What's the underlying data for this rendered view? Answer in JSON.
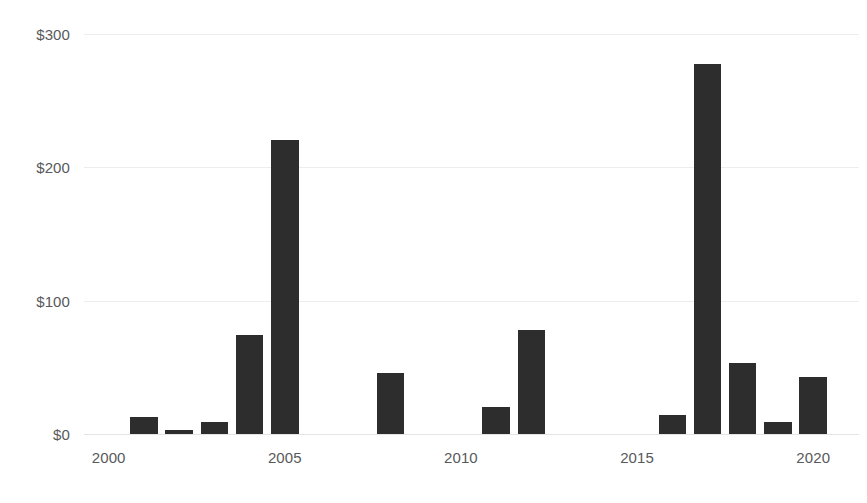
{
  "chart_data": {
    "type": "bar",
    "title": "",
    "subtitle": "",
    "xlabel": "",
    "ylabel": "",
    "xlim": [
      1999.3,
      2021.3
    ],
    "ylim": [
      0,
      300
    ],
    "grid": true,
    "legend": false,
    "bar_color": "#2d2d2d",
    "gridline_color": "#ededed",
    "axis_label_color": "#58595b",
    "background_color": "#ffffff",
    "y_ticks": [
      {
        "value": 0,
        "label": "$0"
      },
      {
        "value": 100,
        "label": "$100"
      },
      {
        "value": 200,
        "label": "$200"
      },
      {
        "value": 300,
        "label": "$300"
      }
    ],
    "x_ticks": [
      {
        "value": 2000,
        "label": "2000"
      },
      {
        "value": 2005,
        "label": "2005"
      },
      {
        "value": 2010,
        "label": "2010"
      },
      {
        "value": 2015,
        "label": "2015"
      },
      {
        "value": 2020,
        "label": "2020"
      }
    ],
    "categories": [
      2001,
      2002,
      2003,
      2004,
      2005,
      2008,
      2011,
      2012,
      2016,
      2017,
      2018,
      2019,
      2020
    ],
    "values": [
      13,
      3,
      9,
      74,
      220,
      46,
      20,
      78,
      14,
      277,
      53,
      9,
      43
    ],
    "bars": [
      {
        "x": 2001,
        "value": 13
      },
      {
        "x": 2002,
        "value": 3
      },
      {
        "x": 2003,
        "value": 9
      },
      {
        "x": 2004,
        "value": 74
      },
      {
        "x": 2005,
        "value": 220
      },
      {
        "x": 2008,
        "value": 46
      },
      {
        "x": 2011,
        "value": 20
      },
      {
        "x": 2012,
        "value": 78
      },
      {
        "x": 2016,
        "value": 14
      },
      {
        "x": 2017,
        "value": 277
      },
      {
        "x": 2018,
        "value": 53
      },
      {
        "x": 2019,
        "value": 9
      },
      {
        "x": 2020,
        "value": 43
      }
    ]
  }
}
